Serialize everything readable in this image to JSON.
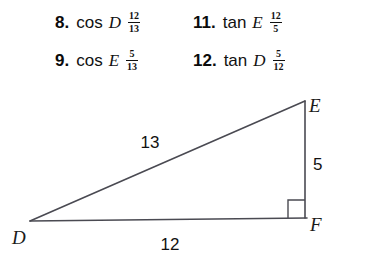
{
  "answers": {
    "rows": [
      {
        "items": [
          {
            "number": "8.",
            "func": "cos",
            "var": "D",
            "num": "12",
            "den": "13"
          },
          {
            "number": "11.",
            "func": "tan",
            "var": "E",
            "num": "12",
            "den": "5"
          }
        ]
      },
      {
        "items": [
          {
            "number": "9.",
            "func": "cos",
            "var": "E",
            "num": "5",
            "den": "13"
          },
          {
            "number": "12.",
            "func": "tan",
            "var": "D",
            "num": "5",
            "den": "12"
          }
        ]
      }
    ]
  },
  "figure": {
    "type": "right-triangle",
    "vertices": [
      {
        "name": "D",
        "label": "D",
        "x": 30,
        "y": 135
      },
      {
        "name": "E",
        "label": "E",
        "x": 305,
        "y": 15
      },
      {
        "name": "F",
        "label": "F",
        "x": 305,
        "y": 132
      }
    ],
    "sides": [
      {
        "name": "hypotenuse-DE",
        "label": "13",
        "x": 150,
        "y": 56
      },
      {
        "name": "leg-EF",
        "label": "5",
        "x": 313,
        "y": 78
      },
      {
        "name": "leg-DF",
        "label": "12",
        "x": 163,
        "y": 157
      }
    ],
    "right_angle_at": "F",
    "colors": {
      "stroke": "#4a4a52",
      "label": "#1a1a1a",
      "background": "#ffffff"
    }
  }
}
